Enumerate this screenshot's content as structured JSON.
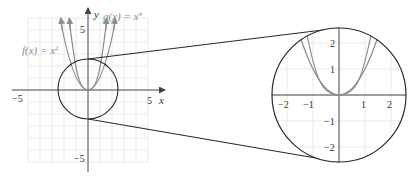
{
  "figure": {
    "colors": {
      "grid": "#e4e4e4",
      "axis": "#444444",
      "curve": "#8c8c8c",
      "circle": "#2a2a2a",
      "text": "#333333",
      "function_label": "#8a8a8a"
    },
    "main_plot": {
      "x_axis_label": "x",
      "y_axis_label": "y",
      "x_tick_labels": {
        "neg": "−5",
        "pos": "5"
      },
      "y_tick_labels": {
        "pos": "5",
        "neg": "−5"
      },
      "x_range": [
        -5,
        5
      ],
      "y_range": [
        -5,
        5
      ],
      "grid_step": 1,
      "zoom_circle": {
        "center": [
          0,
          0
        ],
        "radius": 2.5
      }
    },
    "functions": [
      {
        "name": "f",
        "label_lhs": "f(x) = x",
        "exponent": "2",
        "expr": "x^2"
      },
      {
        "name": "g",
        "label_lhs": "g(x) = x",
        "exponent": "4",
        "expr": "x^4"
      }
    ],
    "inset": {
      "x_tick_labels": [
        "−2",
        "−1",
        "1",
        "2"
      ],
      "y_tick_labels": [
        "2",
        "1",
        "−1",
        "−2"
      ],
      "x_range": [
        -2.5,
        2.5
      ],
      "y_range": [
        -2.5,
        2.5
      ]
    }
  }
}
